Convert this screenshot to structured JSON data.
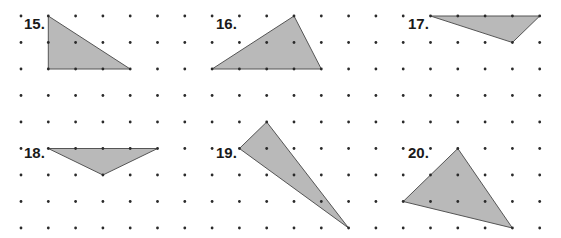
{
  "grid": {
    "origin_x": 21,
    "origin_y": 16,
    "step_x": 27.3,
    "step_y": 26.5,
    "columns": 20,
    "rows": 9,
    "dot_radius": 1.4,
    "dot_color": "#2a2a2a"
  },
  "style": {
    "fill": "#b9b9b9",
    "stroke": "#555555"
  },
  "problems": [
    {
      "number": "15.",
      "label_pos": [
        24,
        29
      ],
      "vertices": [
        [
          1,
          0
        ],
        [
          1,
          2
        ],
        [
          4,
          2
        ]
      ]
    },
    {
      "number": "16.",
      "label_pos": [
        216,
        29
      ],
      "vertices": [
        [
          7,
          2
        ],
        [
          10,
          0
        ],
        [
          11,
          2
        ]
      ]
    },
    {
      "number": "17.",
      "label_pos": [
        408,
        29
      ],
      "vertices": [
        [
          15,
          0
        ],
        [
          19,
          0
        ],
        [
          18,
          1
        ]
      ]
    },
    {
      "number": "18.",
      "label_pos": [
        24,
        158
      ],
      "vertices": [
        [
          1,
          5
        ],
        [
          5,
          5
        ],
        [
          3,
          6
        ]
      ]
    },
    {
      "number": "19.",
      "label_pos": [
        216,
        158
      ],
      "vertices": [
        [
          8,
          5
        ],
        [
          9,
          4
        ],
        [
          12,
          8
        ]
      ]
    },
    {
      "number": "20.",
      "label_pos": [
        408,
        158
      ],
      "vertices": [
        [
          14,
          7
        ],
        [
          16,
          5
        ],
        [
          18,
          8
        ]
      ]
    }
  ]
}
